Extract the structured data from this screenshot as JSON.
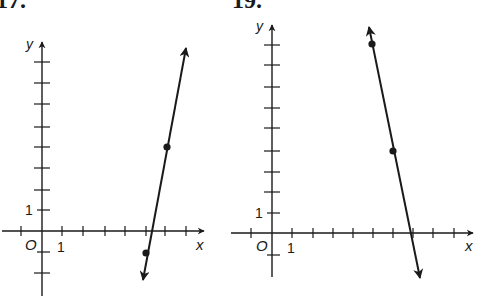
{
  "colors": {
    "ink": "#1a1a1a",
    "background": "#ffffff"
  },
  "graphs": [
    {
      "problem_label": "17.",
      "x_axis_label": "x",
      "y_axis_label": "y",
      "origin_label": "O",
      "x_unit_label": "1",
      "y_unit_label": "1",
      "x_ticks": [
        -1,
        1,
        2,
        3,
        4,
        5,
        6,
        7
      ],
      "y_ticks": [
        -2,
        -1,
        1,
        2,
        3,
        4,
        5,
        6,
        7,
        8
      ],
      "points": [
        {
          "x": 5,
          "y": -1
        },
        {
          "x": 6,
          "y": 4
        }
      ],
      "line": "passes through (5,-1) and (6,4); arrows at both ends"
    },
    {
      "problem_label": "19.",
      "x_axis_label": "x",
      "y_axis_label": "y",
      "origin_label": "O",
      "x_unit_label": "1",
      "y_unit_label": "1",
      "x_ticks": [
        -1,
        1,
        2,
        3,
        4,
        5,
        6,
        7,
        8,
        9
      ],
      "y_ticks": [
        -1,
        1,
        2,
        3,
        4,
        5,
        6,
        7,
        8,
        9
      ],
      "points": [
        {
          "x": 5,
          "y": 9
        },
        {
          "x": 6,
          "y": 4
        }
      ],
      "line": "passes through (5,9) and (6,4); arrows at both ends"
    }
  ]
}
